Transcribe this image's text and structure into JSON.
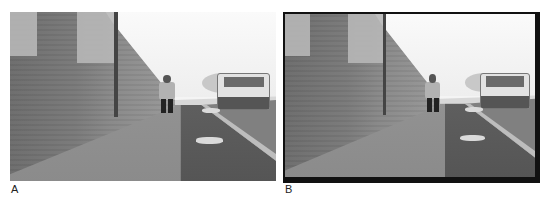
{
  "figure": {
    "panels": [
      {
        "label": "A",
        "description": "Photograph: child walking on sidewalk beside brick wall, grass strip and parked white car on right",
        "border": "none"
      },
      {
        "label": "B",
        "description": "Same photograph with black frame border",
        "border": "black frame"
      }
    ]
  },
  "colors": {
    "background": "#ffffff",
    "frame": "#111111"
  }
}
